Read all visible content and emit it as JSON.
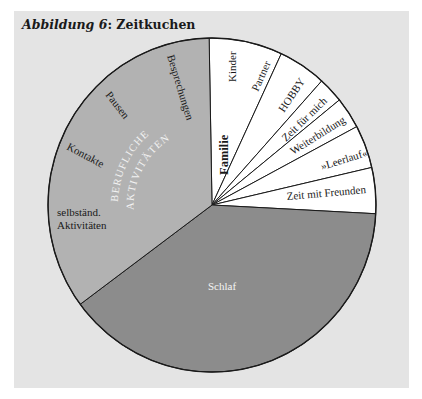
{
  "figure": {
    "title_prefix": "Abbildung 6",
    "title_rest": ": Zeitkuchen"
  },
  "colors": {
    "panel_bg": "#e4e4e4",
    "berufliche": "#b2b2b2",
    "schlaf": "#8c8c8c",
    "private": "#ffffff",
    "outline": "#1a1a1a"
  },
  "chart_data": {
    "type": "pie",
    "title": "Abbildung 6: Zeitkuchen",
    "start_angle_deg": -1,
    "direction": "clockwise",
    "slices": [
      {
        "label": "Familie",
        "sublabels": [
          "Kinder",
          "Partner"
        ],
        "angle_deg": 26,
        "percent": 7.2,
        "color": "#ffffff"
      },
      {
        "label": "HOBBY",
        "angle_deg": 17,
        "percent": 4.7,
        "color": "#ffffff"
      },
      {
        "label": "Zeit für mich",
        "angle_deg": 9,
        "percent": 2.5,
        "color": "#ffffff"
      },
      {
        "label": "Weiterbildung",
        "angle_deg": 11,
        "percent": 3.1,
        "color": "#ffffff"
      },
      {
        "label": "»Leerlauf«",
        "angle_deg": 15,
        "percent": 4.2,
        "color": "#ffffff"
      },
      {
        "label": "Zeit mit Freunden",
        "angle_deg": 16,
        "percent": 4.4,
        "color": "#ffffff"
      },
      {
        "label": "Schlaf",
        "angle_deg": 140.5,
        "percent": 39.0,
        "color": "#8c8c8c"
      },
      {
        "label": "BERUFLICHE AKTIVITÄTEN",
        "sublabels": [
          "selbständ. Aktivitäten",
          "Kontakte",
          "Pausen",
          "Besprechungen"
        ],
        "angle_deg": 125.5,
        "percent": 34.9,
        "color": "#b2b2b2"
      }
    ]
  },
  "labels": {
    "kinder": "Kinder",
    "partner": "Partner",
    "familie": "Familie",
    "hobby": "HOBBY",
    "zeit_fuer_mich": "Zeit für mich",
    "weiterbildung": "Weiterbildung",
    "leerlauf": "»Leerlauf«",
    "zeit_mit_freunden": "Zeit mit Freunden",
    "schlaf": "Schlaf",
    "besprechungen": "Besprechungen",
    "pausen": "Pausen",
    "kontakte": "Kontakte",
    "selbstaend_1": "selbständ.",
    "selbstaend_2": "Aktivitäten",
    "berufliche_1": "BERUFLICHE",
    "berufliche_2": "AKTIVITÄTEN"
  }
}
